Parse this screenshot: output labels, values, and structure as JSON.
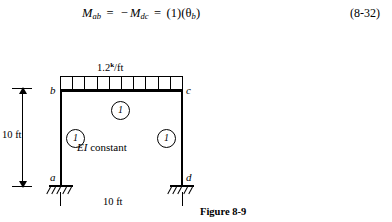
{
  "equation": {
    "lhs_symbol": "M",
    "lhs_sub": "ab",
    "eq_sign": "=",
    "minus_sign": "−",
    "rhs_symbol": "M",
    "rhs_sub": "dc",
    "eq_sign2": "=",
    "result": "(1)(θ",
    "result_sub": "b",
    "result_close": ")",
    "number": "(8-32)",
    "plain_text": "M_ab = −M_dc = (1)(θ_b)"
  },
  "figure": {
    "caption": "Figure 8-9",
    "load": {
      "magnitude": "1.2",
      "unit_sup": "k",
      "unit_rest": "/ft",
      "full_label": "1.2 k/ft",
      "cell_count": 10
    },
    "nodes": {
      "top_left": "b",
      "top_right": "c",
      "bottom_left": "a",
      "bottom_right": "d"
    },
    "member_tags": {
      "beam": "1",
      "left_column": "1",
      "right_column": "1"
    },
    "note": {
      "symbol": "EI",
      "text": " constant",
      "full": "EI constant"
    },
    "dimensions": {
      "height": "10 ft",
      "width": "10 ft"
    },
    "supports": {
      "type": "fixed",
      "hatch_marks": 5
    },
    "colors": {
      "ink": "#000000",
      "paper": "#ffffff"
    }
  }
}
